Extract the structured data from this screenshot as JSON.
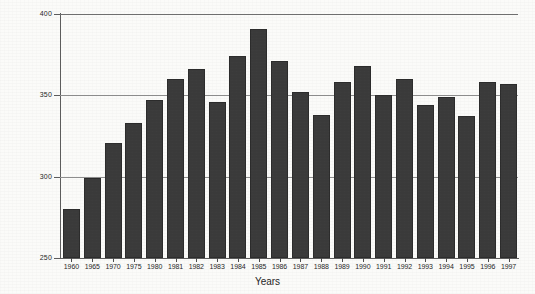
{
  "chart_data": {
    "type": "bar",
    "title": "",
    "xlabel": "Years",
    "ylabel": "",
    "ylim": [
      250,
      400
    ],
    "yticks": [
      250,
      300,
      350,
      400
    ],
    "grid": true,
    "legend": null,
    "categories": [
      "1960",
      "1965",
      "1970",
      "1975",
      "1980",
      "1981",
      "1982",
      "1983",
      "1984",
      "1985",
      "1986",
      "1987",
      "1988",
      "1989",
      "1990",
      "1991",
      "1992",
      "1993",
      "1994",
      "1995",
      "1996",
      "1997"
    ],
    "values": [
      280,
      299,
      321,
      333,
      347,
      360,
      366,
      346,
      374,
      391,
      371,
      352,
      338,
      358,
      368,
      350,
      360,
      344,
      349,
      337,
      358,
      357
    ],
    "bar_color": "#3a3a3a",
    "background_color": "#fbfbf9",
    "gridline_color": "#8d8d8d",
    "axis_color": "#5c5c5c"
  }
}
